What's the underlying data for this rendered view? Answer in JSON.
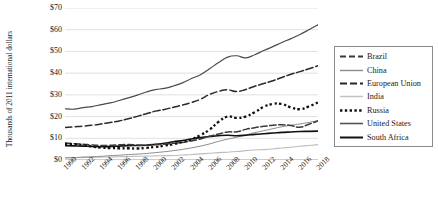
{
  "chart_data": {
    "type": "line",
    "title": "",
    "xlabel": "",
    "ylabel": "Thousands of 2011 international dollars",
    "ytick_labels": [
      "$70",
      "$60",
      "$50",
      "$40",
      "$30",
      "$20",
      "$10",
      "$0"
    ],
    "ytick_values": [
      70,
      60,
      50,
      40,
      30,
      20,
      10,
      0
    ],
    "ylim": [
      0,
      70
    ],
    "grid": "horizontal",
    "legend_position": "right",
    "x": [
      1990,
      1991,
      1992,
      1993,
      1994,
      1995,
      1996,
      1997,
      1998,
      1999,
      2000,
      2001,
      2002,
      2003,
      2004,
      2005,
      2006,
      2007,
      2008,
      2009,
      2010,
      2011,
      2012,
      2013,
      2014,
      2015,
      2016,
      2017,
      2018
    ],
    "xtick_labels": [
      "1990",
      "1992",
      "1994",
      "1996",
      "1998",
      "2000",
      "2002",
      "2004",
      "2006",
      "2008",
      "2010",
      "2012",
      "2014",
      "2016",
      "2018"
    ],
    "xlim": [
      1990,
      2018
    ],
    "series": [
      {
        "name": "Brazil",
        "style": "dashed",
        "color": "#3a3a3a",
        "values": [
          7.7,
          7.4,
          7.2,
          7.4,
          7.6,
          7.8,
          7.9,
          8.0,
          7.9,
          7.9,
          8.1,
          8.1,
          8.2,
          8.1,
          8.5,
          8.6,
          8.9,
          9.4,
          9.8,
          9.6,
          10.4,
          10.7,
          10.8,
          11.1,
          11.1,
          10.6,
          10.2,
          10.3,
          10.4
        ]
      },
      {
        "name": "China",
        "style": "solid-thin",
        "color": "#8c8c8c",
        "values": [
          1.5,
          1.6,
          1.8,
          2.0,
          2.2,
          2.4,
          2.6,
          2.8,
          3.0,
          3.2,
          3.5,
          3.7,
          4.0,
          4.4,
          4.8,
          5.3,
          5.9,
          6.7,
          7.3,
          7.9,
          8.7,
          9.5,
          10.2,
          11.0,
          11.8,
          12.5,
          13.3,
          14.1,
          15.0
        ]
      },
      {
        "name": "European Union",
        "style": "dash-dot",
        "color": "#2a2a2a",
        "values": [
          15.0,
          15.2,
          15.4,
          15.4,
          15.9,
          16.4,
          16.8,
          17.5,
          18.1,
          18.7,
          19.5,
          20.0,
          20.3,
          20.7,
          21.4,
          22.0,
          23.0,
          23.9,
          23.9,
          22.6,
          23.2,
          23.8,
          23.6,
          23.7,
          24.2,
          24.9,
          25.5,
          26.3,
          26.9
        ]
      },
      {
        "name": "India",
        "style": "solid-light",
        "color": "#bdbdbd",
        "values": [
          1.2,
          1.2,
          1.3,
          1.3,
          1.4,
          1.5,
          1.6,
          1.6,
          1.7,
          1.8,
          1.9,
          1.9,
          2.0,
          2.1,
          2.3,
          2.5,
          2.7,
          2.9,
          3.0,
          3.2,
          3.5,
          3.7,
          3.8,
          4.0,
          4.3,
          4.6,
          4.9,
          5.2,
          5.4
        ]
      },
      {
        "name": "Russia",
        "style": "dotted",
        "color": "#111111",
        "values": [
          7.4,
          7.0,
          6.0,
          5.5,
          4.8,
          4.6,
          4.4,
          4.5,
          4.3,
          4.6,
          5.1,
          5.4,
          5.7,
          6.2,
          6.7,
          7.3,
          8.0,
          8.8,
          9.1,
          8.3,
          8.7,
          9.1,
          9.4,
          9.5,
          9.5,
          9.2,
          9.2,
          9.4,
          9.7
        ]
      },
      {
        "name": "United States",
        "style": "solid-medium",
        "color": "#4a4a4a",
        "values": [
          23.7,
          23.5,
          24.0,
          24.4,
          25.2,
          25.6,
          26.4,
          27.3,
          28.2,
          29.3,
          30.2,
          30.2,
          30.5,
          31.1,
          32.0,
          32.9,
          33.5,
          33.8,
          33.4,
          32.3,
          32.9,
          33.2,
          33.8,
          34.1,
          34.8,
          35.5,
          35.8,
          36.5,
          37.4
        ]
      },
      {
        "name": "South Africa",
        "style": "solid-black",
        "color": "#111111",
        "values": [
          6.5,
          6.3,
          6.0,
          5.9,
          6.0,
          6.1,
          6.3,
          6.3,
          6.2,
          6.3,
          6.5,
          6.6,
          6.8,
          7.0,
          7.3,
          7.6,
          8.0,
          8.3,
          8.4,
          8.0,
          8.2,
          8.4,
          8.5,
          8.6,
          8.6,
          8.6,
          8.5,
          8.5,
          8.4
        ]
      }
    ],
    "display_series": [
      {
        "name": "United States",
        "points": [
          [
            1990,
            23.6
          ],
          [
            1991,
            23.4
          ],
          [
            1992,
            24.1
          ],
          [
            1993,
            24.6
          ],
          [
            1994,
            25.5
          ],
          [
            1995,
            26.3
          ],
          [
            1996,
            27.4
          ],
          [
            1997,
            28.6
          ],
          [
            1998,
            29.9
          ],
          [
            1999,
            31.3
          ],
          [
            2000,
            32.4
          ],
          [
            2001,
            33.0
          ],
          [
            2002,
            34.1
          ],
          [
            2003,
            35.5
          ],
          [
            2004,
            37.5
          ],
          [
            2005,
            39.3
          ],
          [
            2006,
            42.0
          ],
          [
            2007,
            44.9
          ],
          [
            2008,
            47.4
          ],
          [
            2009,
            48.0
          ],
          [
            2010,
            47.0
          ],
          [
            2011,
            48.5
          ],
          [
            2012,
            50.4
          ],
          [
            2013,
            52.2
          ],
          [
            2014,
            54.1
          ],
          [
            2015,
            55.9
          ],
          [
            2016,
            57.8
          ],
          [
            2017,
            60.0
          ],
          [
            2018,
            62.3
          ]
        ]
      },
      {
        "name": "European Union",
        "points": [
          [
            1990,
            15.0
          ],
          [
            1991,
            15.3
          ],
          [
            1992,
            15.6
          ],
          [
            1993,
            16.0
          ],
          [
            1994,
            16.6
          ],
          [
            1995,
            17.3
          ],
          [
            1996,
            18.0
          ],
          [
            1997,
            19.0
          ],
          [
            1998,
            20.1
          ],
          [
            1999,
            21.3
          ],
          [
            2000,
            22.5
          ],
          [
            2001,
            23.3
          ],
          [
            2002,
            24.3
          ],
          [
            2003,
            25.3
          ],
          [
            2004,
            26.5
          ],
          [
            2005,
            28.0
          ],
          [
            2006,
            30.2
          ],
          [
            2007,
            31.6
          ],
          [
            2008,
            32.3
          ],
          [
            2009,
            31.5
          ],
          [
            2010,
            32.5
          ],
          [
            2011,
            34.0
          ],
          [
            2012,
            35.2
          ],
          [
            2013,
            36.5
          ],
          [
            2014,
            38.0
          ],
          [
            2015,
            39.5
          ],
          [
            2016,
            40.7
          ],
          [
            2017,
            42.0
          ],
          [
            2018,
            43.4
          ]
        ]
      },
      {
        "name": "Russia",
        "points": [
          [
            1990,
            7.4
          ],
          [
            1991,
            7.3
          ],
          [
            1992,
            6.9
          ],
          [
            1993,
            6.2
          ],
          [
            1994,
            5.7
          ],
          [
            1995,
            5.5
          ],
          [
            1996,
            5.4
          ],
          [
            1997,
            5.4
          ],
          [
            1998,
            5.3
          ],
          [
            1999,
            5.6
          ],
          [
            2000,
            6.0
          ],
          [
            2001,
            6.6
          ],
          [
            2002,
            7.3
          ],
          [
            2003,
            8.3
          ],
          [
            2004,
            9.5
          ],
          [
            2005,
            11.5
          ],
          [
            2006,
            14.0
          ],
          [
            2007,
            17.6
          ],
          [
            2008,
            20.0
          ],
          [
            2009,
            19.4
          ],
          [
            2010,
            20.0
          ],
          [
            2011,
            22.0
          ],
          [
            2012,
            24.5
          ],
          [
            2013,
            25.8
          ],
          [
            2014,
            25.8
          ],
          [
            2015,
            24.2
          ],
          [
            2016,
            23.4
          ],
          [
            2017,
            24.7
          ],
          [
            2018,
            26.5
          ]
        ]
      },
      {
        "name": "Brazil",
        "points": [
          [
            1990,
            7.8
          ],
          [
            1991,
            7.5
          ],
          [
            1992,
            7.3
          ],
          [
            1993,
            6.9
          ],
          [
            1994,
            6.7
          ],
          [
            1995,
            6.8
          ],
          [
            1996,
            7.0
          ],
          [
            1997,
            7.1
          ],
          [
            1998,
            6.9
          ],
          [
            1999,
            6.8
          ],
          [
            2000,
            7.1
          ],
          [
            2001,
            7.3
          ],
          [
            2002,
            7.7
          ],
          [
            2003,
            8.1
          ],
          [
            2004,
            8.8
          ],
          [
            2005,
            9.7
          ],
          [
            2006,
            10.9
          ],
          [
            2007,
            12.0
          ],
          [
            2008,
            12.9
          ],
          [
            2009,
            13.0
          ],
          [
            2010,
            14.1
          ],
          [
            2011,
            14.9
          ],
          [
            2012,
            15.5
          ],
          [
            2013,
            16.0
          ],
          [
            2014,
            16.2
          ],
          [
            2015,
            15.9
          ],
          [
            2016,
            15.1
          ],
          [
            2017,
            16.5
          ],
          [
            2018,
            18.0
          ]
        ]
      },
      {
        "name": "South Africa",
        "points": [
          [
            1990,
            6.6
          ],
          [
            1991,
            6.5
          ],
          [
            1992,
            6.4
          ],
          [
            1993,
            6.2
          ],
          [
            1994,
            6.1
          ],
          [
            1995,
            6.2
          ],
          [
            1996,
            6.4
          ],
          [
            1997,
            6.6
          ],
          [
            1998,
            6.7
          ],
          [
            1999,
            6.8
          ],
          [
            2000,
            7.2
          ],
          [
            2001,
            7.7
          ],
          [
            2002,
            8.4
          ],
          [
            2003,
            9.0
          ],
          [
            2004,
            9.7
          ],
          [
            2005,
            10.3
          ],
          [
            2006,
            10.8
          ],
          [
            2007,
            11.2
          ],
          [
            2008,
            11.4
          ],
          [
            2009,
            11.2
          ],
          [
            2010,
            11.4
          ],
          [
            2011,
            11.8
          ],
          [
            2012,
            12.1
          ],
          [
            2013,
            12.4
          ],
          [
            2014,
            12.7
          ],
          [
            2015,
            12.9
          ],
          [
            2016,
            13.1
          ],
          [
            2017,
            13.2
          ],
          [
            2018,
            13.3
          ]
        ]
      },
      {
        "name": "China",
        "points": [
          [
            1990,
            1.0
          ],
          [
            1991,
            1.1
          ],
          [
            1992,
            1.3
          ],
          [
            1993,
            1.5
          ],
          [
            1994,
            1.7
          ],
          [
            1995,
            2.0
          ],
          [
            1996,
            2.2
          ],
          [
            1997,
            2.5
          ],
          [
            1998,
            2.7
          ],
          [
            1999,
            3.0
          ],
          [
            2000,
            3.4
          ],
          [
            2001,
            3.8
          ],
          [
            2002,
            4.3
          ],
          [
            2003,
            4.9
          ],
          [
            2004,
            5.6
          ],
          [
            2005,
            6.4
          ],
          [
            2006,
            7.4
          ],
          [
            2007,
            8.6
          ],
          [
            2008,
            9.6
          ],
          [
            2009,
            10.5
          ],
          [
            2010,
            11.6
          ],
          [
            2011,
            12.6
          ],
          [
            2012,
            13.5
          ],
          [
            2013,
            14.4
          ],
          [
            2014,
            15.3
          ],
          [
            2015,
            16.0
          ],
          [
            2016,
            16.6
          ],
          [
            2017,
            17.3
          ],
          [
            2018,
            18.2
          ]
        ]
      },
      {
        "name": "India",
        "points": [
          [
            1990,
            1.1
          ],
          [
            1991,
            1.1
          ],
          [
            1992,
            1.2
          ],
          [
            1993,
            1.2
          ],
          [
            1994,
            1.3
          ],
          [
            1995,
            1.4
          ],
          [
            1996,
            1.5
          ],
          [
            1997,
            1.6
          ],
          [
            1998,
            1.7
          ],
          [
            1999,
            1.8
          ],
          [
            2000,
            1.9
          ],
          [
            2001,
            2.0
          ],
          [
            2002,
            2.1
          ],
          [
            2003,
            2.3
          ],
          [
            2004,
            2.5
          ],
          [
            2005,
            2.8
          ],
          [
            2006,
            3.1
          ],
          [
            2007,
            3.4
          ],
          [
            2008,
            3.6
          ],
          [
            2009,
            3.9
          ],
          [
            2010,
            4.3
          ],
          [
            2011,
            4.6
          ],
          [
            2012,
            4.8
          ],
          [
            2013,
            5.1
          ],
          [
            2014,
            5.5
          ],
          [
            2015,
            5.9
          ],
          [
            2016,
            6.3
          ],
          [
            2017,
            6.7
          ],
          [
            2018,
            7.1
          ]
        ]
      }
    ]
  },
  "legend": {
    "items": [
      {
        "label": "Brazil",
        "style": "dashed",
        "color": "#3b3b3b"
      },
      {
        "label": "China",
        "style": "solid-thin",
        "color": "#8c8c8c"
      },
      {
        "label": "European Union",
        "style": "dash-dot",
        "color": "#262626"
      },
      {
        "label": "India",
        "style": "solid-light",
        "color": "#c2c2c2"
      },
      {
        "label": "Russia",
        "style": "dotted",
        "color": "#111111"
      },
      {
        "label": "United States",
        "style": "solid-medium",
        "color": "#555555"
      },
      {
        "label": "South Africa",
        "style": "solid-black",
        "color": "#111111"
      }
    ]
  }
}
